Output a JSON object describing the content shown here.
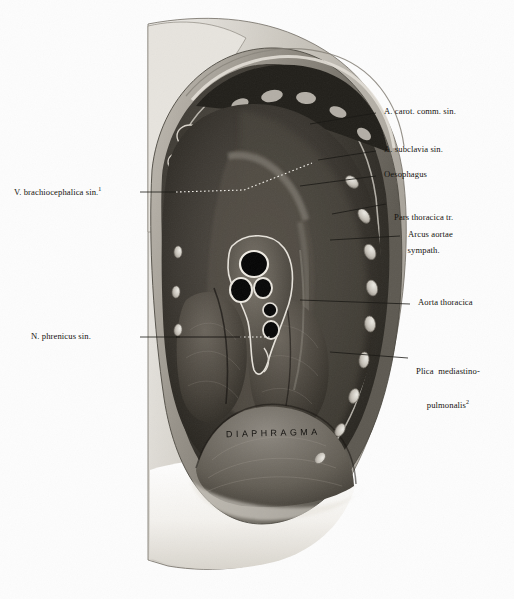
{
  "plate": {
    "background_color": "#fdfdfd",
    "ink_color": "#15130f",
    "center_caption": "DIAPHRAGMA"
  },
  "labels_right": [
    {
      "text": "A. carot. comm. sin.",
      "lines": [
        "A. carot. comm. sin."
      ]
    },
    {
      "text": "A. subclavia sin.",
      "lines": [
        "A. subclavia sin."
      ]
    },
    {
      "text": "Oesophagus",
      "lines": [
        "Oesophagus"
      ]
    },
    {
      "text": "Pars thoracica tr. sympath.",
      "lines": [
        "Pars thoracica tr.",
        "sympath."
      ]
    },
    {
      "text": "Arcus aortae",
      "lines": [
        "Arcus aortae"
      ]
    },
    {
      "text": "Aorta thoracica",
      "lines": [
        "Aorta thoracica"
      ]
    },
    {
      "text": "Plica mediastino-pulmonalis",
      "lines": [
        "Plica  mediastino-",
        "pulmonalis"
      ],
      "footnote": "2"
    }
  ],
  "labels_left": [
    {
      "text": "V. brachiocephalica sin.",
      "lines": [
        "V. brachiocephalica sin."
      ],
      "footnote": "1"
    },
    {
      "text": "N. phrenicus sin.",
      "lines": [
        "N. phrenicus sin."
      ]
    }
  ]
}
